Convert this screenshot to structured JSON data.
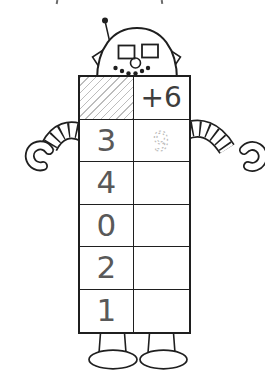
{
  "worksheet": {
    "machine": {
      "rule": "+6",
      "header": {
        "input_cell": "hatched",
        "rule_cell": "+6"
      },
      "rows": [
        {
          "input": "3",
          "output": "9",
          "output_style": "traced-gray-dotted"
        },
        {
          "input": "4",
          "output": ""
        },
        {
          "input": "0",
          "output": ""
        },
        {
          "input": "2",
          "output": ""
        },
        {
          "input": "1",
          "output": ""
        }
      ]
    },
    "colors": {
      "line_art": "#1f1f1f",
      "input_digits": "#595959",
      "rule_text": "#3d3d3d",
      "traced_digit": "#b8b8b8",
      "hatch_lines": "#bdbdbd",
      "background": "#ffffff"
    }
  }
}
